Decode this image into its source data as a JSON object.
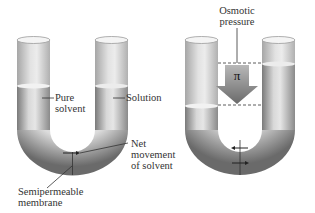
{
  "left_panel": {
    "labels": {
      "pure_solvent": [
        "Pure",
        "solvent"
      ],
      "solution": "Solution",
      "net_movement": [
        "Net",
        "movement",
        "of solvent"
      ],
      "membrane": [
        "Semipermeable",
        "membrane"
      ]
    }
  },
  "right_panel": {
    "labels": {
      "osmotic_pressure": [
        "Osmotic",
        "pressure"
      ],
      "pi_symbol": "π"
    }
  },
  "colors": {
    "tube_dark": "#6e6e6e",
    "tube_light": "#e4e4e4",
    "liquid_line": "#f2f2f2",
    "arrow_fill": "#7a7a7a",
    "text": "#333333",
    "background": "#ffffff"
  }
}
